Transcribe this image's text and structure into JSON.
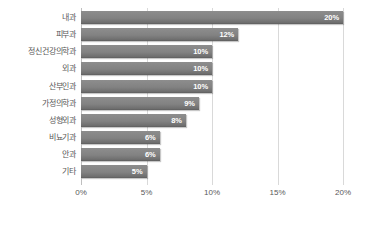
{
  "chart_data": {
    "type": "bar",
    "orientation": "horizontal",
    "title": "",
    "xlabel": "",
    "ylabel": "",
    "categories": [
      "내과",
      "피부과",
      "정신건강의학과",
      "외과",
      "산부인과",
      "가정의학과",
      "성형외과",
      "비뇨기과",
      "안과",
      "기타"
    ],
    "values": [
      20,
      12,
      10,
      10,
      10,
      9,
      8,
      6,
      6,
      5
    ],
    "value_labels": [
      "20%",
      "12%",
      "10%",
      "10%",
      "10%",
      "9%",
      "8%",
      "6%",
      "6%",
      "5%"
    ],
    "xlim": [
      0,
      20
    ],
    "xticks": [
      0,
      5,
      10,
      15,
      20
    ],
    "xtick_labels": [
      "0%",
      "5%",
      "10%",
      "15%",
      "20%"
    ],
    "grid": true,
    "legend": false,
    "bar_color": "#808080",
    "value_label_color": "#ffffff",
    "axis_text_color": "#595959",
    "gridline_color": "#d9d9d9",
    "background_color": "#ffffff"
  }
}
